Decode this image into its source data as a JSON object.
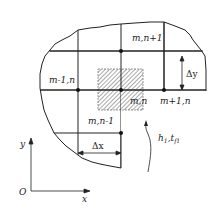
{
  "diagram": {
    "nodes": [
      {
        "id": "top",
        "label": "m,n+1"
      },
      {
        "id": "left",
        "label": "m-1,n"
      },
      {
        "id": "center",
        "label": "m,n"
      },
      {
        "id": "right",
        "label": "m+1,n"
      },
      {
        "id": "bottom",
        "label": "m,n-1"
      }
    ],
    "dimensions": {
      "dx": "Δx",
      "dy": "Δy"
    },
    "boundary": {
      "h": "h",
      "h_sub": "1",
      "t": "t",
      "t_sub": "f1",
      "separator": ","
    },
    "axes": {
      "origin": "O",
      "x": "x",
      "y": "y"
    },
    "colors": {
      "line": "#222222",
      "hatch": "#555555"
    }
  }
}
